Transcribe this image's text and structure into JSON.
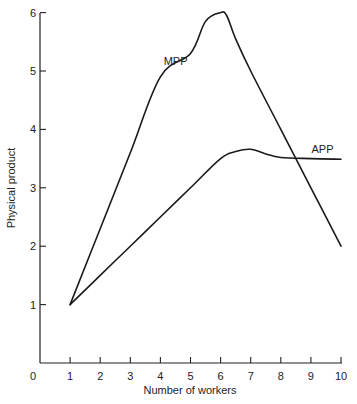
{
  "chart_data": {
    "type": "line",
    "title": "",
    "xlabel": "Number of workers",
    "ylabel": "Physical product",
    "xlim": [
      0,
      10
    ],
    "ylim": [
      0,
      6
    ],
    "x_ticks": [
      1,
      2,
      3,
      4,
      5,
      6,
      7,
      8,
      9,
      10
    ],
    "y_ticks": [
      1,
      2,
      3,
      4,
      5,
      6
    ],
    "origin_label": "0",
    "grid": false,
    "legend": "none (series labelled inline)",
    "series": [
      {
        "name": "MPP",
        "x": [
          1,
          2,
          3,
          4,
          5,
          5.5,
          6,
          6.2,
          6.5,
          7,
          8,
          9,
          10
        ],
        "values": [
          1,
          2.3,
          3.6,
          4.9,
          5.3,
          5.85,
          6.0,
          5.95,
          5.55,
          5.0,
          4.0,
          3.0,
          2.0
        ],
        "label_pos": {
          "x": 4.9,
          "y": 5.1
        }
      },
      {
        "name": "APP",
        "x": [
          1,
          2,
          3,
          4,
          5,
          6,
          6.5,
          7,
          7.5,
          8,
          9,
          10
        ],
        "values": [
          1,
          1.5,
          2.0,
          2.5,
          3.0,
          3.5,
          3.62,
          3.66,
          3.58,
          3.52,
          3.5,
          3.49
        ],
        "label_pos": {
          "x": 9.75,
          "y": 3.6
        }
      }
    ]
  }
}
